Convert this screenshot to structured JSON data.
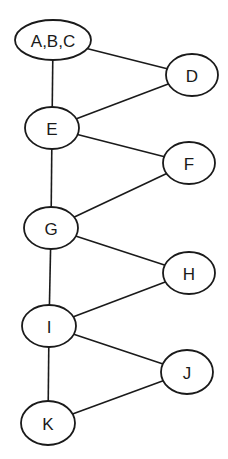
{
  "diagram": {
    "type": "graph",
    "nodes": [
      {
        "id": "ABC",
        "label": "A,B,C",
        "cx": 53,
        "cy": 40,
        "rx": 38,
        "ry": 20
      },
      {
        "id": "D",
        "label": "D",
        "cx": 192,
        "cy": 75,
        "rx": 26,
        "ry": 21
      },
      {
        "id": "E",
        "label": "E",
        "cx": 52,
        "cy": 128,
        "rx": 27,
        "ry": 21
      },
      {
        "id": "F",
        "label": "F",
        "cx": 189,
        "cy": 163,
        "rx": 26,
        "ry": 21
      },
      {
        "id": "G",
        "label": "G",
        "cx": 51,
        "cy": 228,
        "rx": 27,
        "ry": 21
      },
      {
        "id": "H",
        "label": "H",
        "cx": 189,
        "cy": 273,
        "rx": 26,
        "ry": 21
      },
      {
        "id": "I",
        "label": "I",
        "cx": 49,
        "cy": 326,
        "rx": 27,
        "ry": 21
      },
      {
        "id": "J",
        "label": "J",
        "cx": 187,
        "cy": 372,
        "rx": 26,
        "ry": 22
      },
      {
        "id": "K",
        "label": "K",
        "cx": 48,
        "cy": 423,
        "rx": 27,
        "ry": 22
      }
    ],
    "edges": [
      {
        "from": "ABC",
        "to": "D"
      },
      {
        "from": "ABC",
        "to": "E"
      },
      {
        "from": "D",
        "to": "E"
      },
      {
        "from": "E",
        "to": "F"
      },
      {
        "from": "E",
        "to": "G"
      },
      {
        "from": "F",
        "to": "G"
      },
      {
        "from": "G",
        "to": "H"
      },
      {
        "from": "G",
        "to": "I"
      },
      {
        "from": "H",
        "to": "I"
      },
      {
        "from": "I",
        "to": "J"
      },
      {
        "from": "I",
        "to": "K"
      },
      {
        "from": "J",
        "to": "K"
      }
    ]
  }
}
